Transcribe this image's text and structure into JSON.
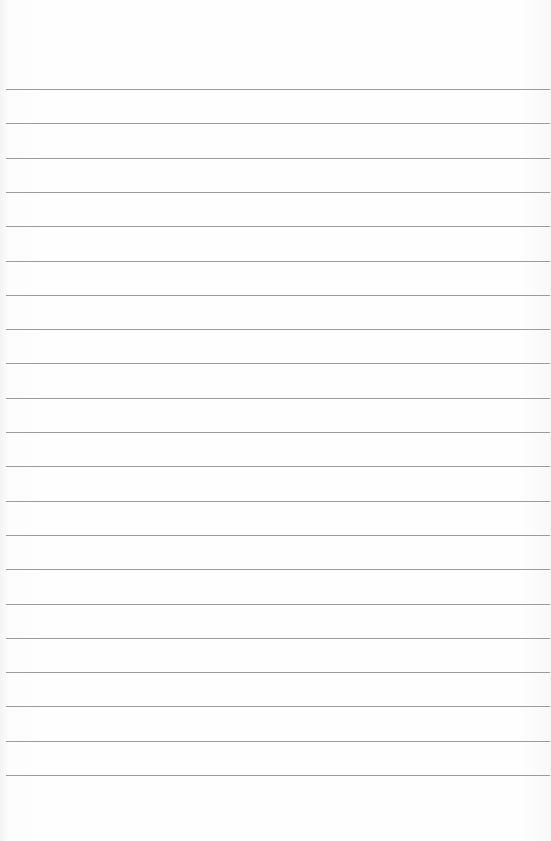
{
  "paper": {
    "type": "lined-paper",
    "line_color": "#8a8a8a",
    "background_color": "#fefefe",
    "line_count": 21,
    "first_line_y": 89,
    "line_spacing": 34.3
  }
}
